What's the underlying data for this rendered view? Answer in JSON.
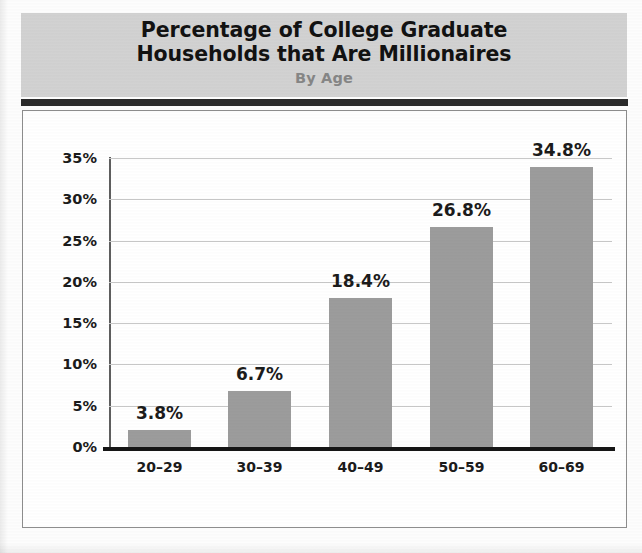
{
  "header": {
    "title_line1": "Percentage of College Graduate",
    "title_line2": "Households that Are Millionaires",
    "subtitle": "By Age",
    "band_color": "#d2d2d2",
    "rule_color": "#2b2b2b"
  },
  "chart_data": {
    "type": "bar",
    "title": "Percentage of College Graduate Households that Are Millionaires",
    "subtitle": "By Age",
    "xlabel": "",
    "ylabel": "",
    "categories": [
      "20–29",
      "30–39",
      "40–49",
      "50–59",
      "60–69"
    ],
    "values": [
      3.8,
      6.7,
      18.4,
      26.8,
      34.8
    ],
    "value_labels": [
      "3.8%",
      "6.7%",
      "18.4%",
      "26.8%",
      "34.8%"
    ],
    "bar_plot_heights": [
      2.1,
      6.8,
      18.0,
      26.6,
      33.9
    ],
    "ylim": [
      0,
      35
    ],
    "yticks": [
      0,
      5,
      10,
      15,
      20,
      25,
      30,
      35
    ],
    "ytick_labels": [
      "0%",
      "5%",
      "10%",
      "15%",
      "20%",
      "25%",
      "30%",
      "35%"
    ],
    "grid": true,
    "gridline_color": "#c8c8c8",
    "bar_color": "#9c9c9c",
    "axis_color": "#161616",
    "legend": null,
    "legend_position": "none"
  }
}
